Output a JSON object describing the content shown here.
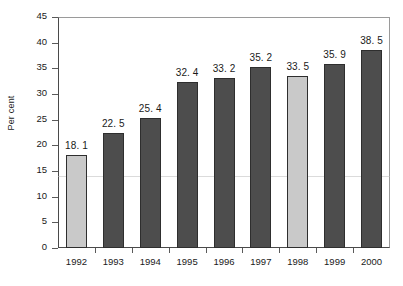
{
  "chart_data": {
    "type": "bar",
    "title": "",
    "subtitle": "",
    "xlabel": "",
    "ylabel": "Per cent",
    "categories": [
      "1992",
      "1993",
      "1994",
      "1995",
      "1996",
      "1997",
      "1998",
      "1999",
      "2000"
    ],
    "values": [
      18.1,
      22.5,
      25.4,
      32.4,
      33.2,
      35.2,
      33.5,
      35.9,
      38.5
    ],
    "data_labels": [
      "18. 1",
      "22. 5",
      "25. 4",
      "32. 4",
      "33. 2",
      "35. 2",
      "33. 5",
      "35. 9",
      "38. 5"
    ],
    "bar_styles": [
      "light",
      "dark",
      "dark",
      "dark",
      "dark",
      "dark",
      "light",
      "dark",
      "dark"
    ],
    "ylim": [
      0,
      45
    ],
    "ytick_labels": [
      "45",
      "40",
      "35",
      "30",
      "25",
      "20",
      "15",
      "10",
      "5",
      "0"
    ],
    "ytick_values": [
      45,
      40,
      35,
      30,
      25,
      20,
      15,
      10,
      5,
      0
    ],
    "grid": false,
    "legend": null,
    "legend_position": "none",
    "colors": {
      "bar_dark": "#4d4d4d",
      "bar_light": "#c9c9c9",
      "bar_border": "#2e2e2e",
      "axis": "#4a4a4a",
      "frame": "#9a9a9a",
      "text": "#1a1a1a",
      "background": "#ffffff"
    }
  },
  "figure": {
    "caption_sliver": ""
  }
}
